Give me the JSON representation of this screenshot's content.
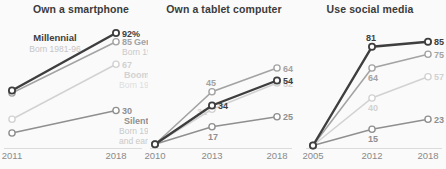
{
  "chart_data": [
    {
      "type": "line",
      "title": "Own a smartphone",
      "x_labels": [
        "2011",
        "2018"
      ],
      "ylim": [
        0,
        100
      ],
      "series": [
        {
          "name": "Millennial",
          "born": "Born 1981-96",
          "color": "#3e3e3e",
          "light_color": "#c6c6c6",
          "values": [
            46,
            92
          ],
          "value_labels": [
            null,
            "92%"
          ]
        },
        {
          "name": "Gen X",
          "born": "Born 1965-80",
          "color": "#a3a3a3",
          "light_color": "#c9c9c9",
          "values": [
            44,
            85
          ],
          "value_labels": [
            null,
            "85"
          ]
        },
        {
          "name": "Boomer",
          "born": "Born 1946-64",
          "color": "#d2d2d2",
          "light_color": "#dedede",
          "values": [
            23,
            67
          ],
          "value_labels": [
            null,
            "67"
          ]
        },
        {
          "name": "Silent",
          "born": "Born 1945 and earlier",
          "color": "#8f8f8f",
          "light_color": "#c9c9c9",
          "values": [
            12,
            30
          ],
          "value_labels": [
            null,
            "30"
          ]
        }
      ]
    },
    {
      "type": "line",
      "title": "Own a tablet computer",
      "x_labels": [
        "2010",
        "2013",
        "2018"
      ],
      "ylim": [
        0,
        100
      ],
      "series": [
        {
          "name": "Millennial",
          "color": "#3e3e3e",
          "values": [
            3,
            34,
            54
          ],
          "value_labels": [
            null,
            "34",
            "54"
          ]
        },
        {
          "name": "Gen X",
          "color": "#a3a3a3",
          "values": [
            3,
            45,
            64
          ],
          "value_labels": [
            null,
            "45",
            "64"
          ]
        },
        {
          "name": "Boomer",
          "color": "#d2d2d2",
          "values": [
            3,
            31,
            52
          ],
          "value_labels": [
            null,
            "31",
            "52"
          ]
        },
        {
          "name": "Silent",
          "color": "#8f8f8f",
          "values": [
            3,
            17,
            25
          ],
          "value_labels": [
            null,
            "17",
            "25"
          ]
        }
      ]
    },
    {
      "type": "line",
      "title": "Use social media",
      "x_labels": [
        "2005",
        "2012",
        "2018"
      ],
      "ylim": [
        0,
        100
      ],
      "series": [
        {
          "name": "Millennial",
          "color": "#3e3e3e",
          "values": [
            2,
            81,
            85
          ],
          "value_labels": [
            null,
            "81",
            "85"
          ]
        },
        {
          "name": "Gen X",
          "color": "#a3a3a3",
          "values": [
            2,
            64,
            75
          ],
          "value_labels": [
            null,
            "64",
            "75"
          ]
        },
        {
          "name": "Boomer",
          "color": "#d2d2d2",
          "values": [
            2,
            40,
            57
          ],
          "value_labels": [
            null,
            "40",
            "57"
          ]
        },
        {
          "name": "Silent",
          "color": "#8f8f8f",
          "values": [
            2,
            15,
            23
          ],
          "value_labels": [
            null,
            "15",
            "23"
          ]
        }
      ]
    }
  ]
}
